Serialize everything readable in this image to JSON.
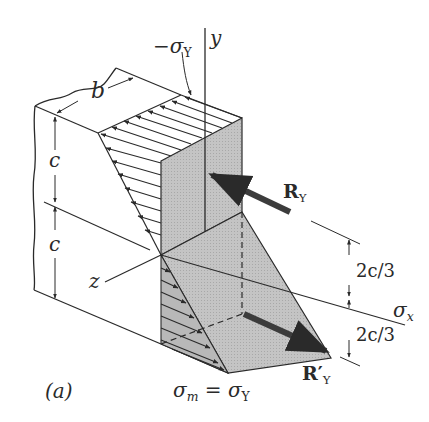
{
  "figure": {
    "panel_label": "(a)",
    "colors": {
      "line": "#2a2a2a",
      "shade": "#bdbdbd",
      "shade_dark": "#a9a9a9",
      "arrow": "#3c3c3c",
      "background": "#ffffff"
    }
  },
  "labels": {
    "b": "b",
    "c_upper": "c",
    "c_lower": "c",
    "y_axis": "y",
    "z_axis": "z",
    "x_axis_sigma": "σ",
    "x_axis_sub": "x",
    "neg_sigma_y_prefix": "−σ",
    "neg_sigma_y_sub": "Y",
    "R_Y": "R",
    "R_Y_sub": "Y",
    "R_prime_Y": "R′",
    "R_prime_Y_sub": "Y",
    "dim_upper": "2c/3",
    "dim_lower": "2c/3",
    "sigma_m_lhs": "σ",
    "sigma_m_sub": "m",
    "sigma_m_eq": " = σ",
    "sigma_m_rhs_sub": "Y"
  }
}
